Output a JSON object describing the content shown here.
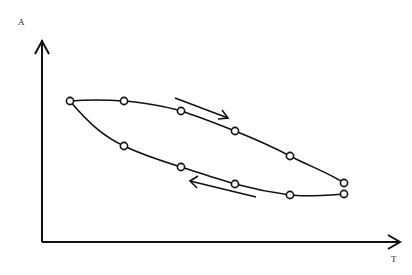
{
  "diagram": {
    "type": "hysteresis-loop",
    "axes": {
      "y_label": "A",
      "x_label": "T"
    },
    "upper_branch_points": [
      [
        70,
        101
      ],
      [
        124,
        101
      ],
      [
        181,
        111
      ],
      [
        235,
        131
      ],
      [
        290,
        156
      ],
      [
        344,
        183
      ]
    ],
    "lower_branch_points": [
      [
        70,
        101
      ],
      [
        124,
        146
      ],
      [
        181,
        167
      ],
      [
        235,
        184
      ],
      [
        290,
        195
      ],
      [
        344,
        194
      ]
    ],
    "arrows": [
      {
        "direction": "right-down",
        "from": [
          175,
          98
        ],
        "to": [
          228,
          118
        ]
      },
      {
        "direction": "left-up",
        "from": [
          256,
          197
        ],
        "to": [
          190,
          181
        ]
      }
    ],
    "colors": {
      "line": "#111111",
      "background": "#ffffff"
    }
  }
}
